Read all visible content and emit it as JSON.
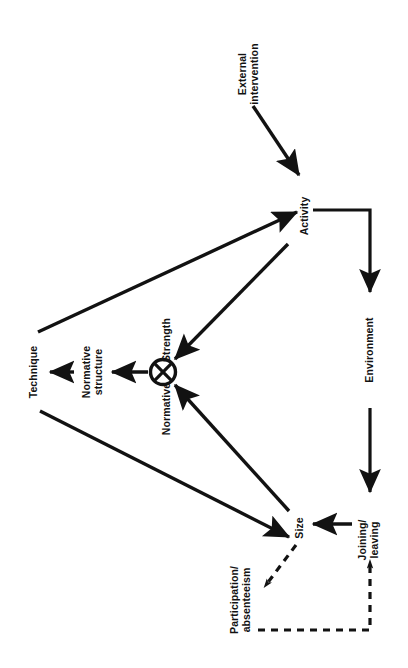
{
  "diagram": {
    "orientation": "labels-rotated-90-ccw",
    "background_color": "#ffffff",
    "stroke_color": "#121212",
    "nodes": {
      "external_intervention": {
        "label": "External\nintervention",
        "x": 248,
        "y": 74
      },
      "activity": {
        "label": "Activity",
        "x": 305,
        "y": 216
      },
      "environment": {
        "label": "Environment",
        "x": 370,
        "y": 350
      },
      "joining_leaving": {
        "label": "Joining/\nleaving",
        "x": 368,
        "y": 540
      },
      "size": {
        "label": "Size",
        "x": 300,
        "y": 528
      },
      "participation_absenteeism": {
        "label": "Participation/\nabsenteeism",
        "x": 240,
        "y": 600
      },
      "strength": {
        "label": "Strength",
        "x": 167,
        "y": 340
      },
      "normative": {
        "label": "Normative",
        "x": 167,
        "y": 409
      },
      "normative_structure": {
        "label": "Normative\nstructure",
        "x": 92,
        "y": 372
      },
      "technique": {
        "label": "Technique",
        "x": 34,
        "y": 372
      },
      "junction": {
        "label": "crossed-circle-junction",
        "x": 163,
        "y": 372,
        "radius": 13
      }
    },
    "edges": [
      {
        "name": "external-intervention-to-activity",
        "style": "solid",
        "arrow": "end"
      },
      {
        "name": "activity-to-environment-elbow",
        "style": "solid",
        "arrow": "end"
      },
      {
        "name": "environment-to-joining-leaving",
        "style": "solid",
        "arrow": "end"
      },
      {
        "name": "joining-leaving-to-size",
        "style": "solid",
        "arrow": "end"
      },
      {
        "name": "size-to-junction",
        "style": "solid",
        "arrow": "end"
      },
      {
        "name": "junction-to-activity",
        "style": "solid",
        "arrow": "end"
      },
      {
        "name": "activity-to-junction",
        "style": "solid",
        "arrow": "end"
      },
      {
        "name": "technique-to-size",
        "style": "solid",
        "arrow": "end"
      },
      {
        "name": "junction-to-normative-structure",
        "style": "solid",
        "arrow": "end"
      },
      {
        "name": "normative-structure-to-technique",
        "style": "solid",
        "arrow": "end"
      },
      {
        "name": "size-to-participation-absenteeism",
        "style": "dashed",
        "arrow": "end"
      },
      {
        "name": "participation-absenteeism-to-joining-leaving",
        "style": "dashed",
        "arrow": "end"
      }
    ]
  }
}
